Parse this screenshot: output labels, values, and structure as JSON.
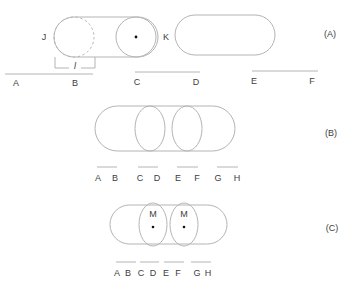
{
  "colors": {
    "stroke": "#b4b4b4",
    "text": "#3d3d3d",
    "dot": "#111111"
  },
  "panel_a": {
    "tag": "(A)",
    "left_label": "J",
    "right_label": "K",
    "length_label": "l",
    "scale_labels": [
      "A",
      "B",
      "C",
      "D",
      "E",
      "F"
    ]
  },
  "panel_b": {
    "tag": "(B)",
    "scale_labels": [
      "A",
      "B",
      "C",
      "D",
      "E",
      "F",
      "G",
      "H"
    ]
  },
  "panel_c": {
    "tag": "(C)",
    "center_labels": [
      "M",
      "M"
    ],
    "scale_labels": [
      "A",
      "B",
      "C",
      "D",
      "E",
      "F",
      "G",
      "H"
    ]
  }
}
